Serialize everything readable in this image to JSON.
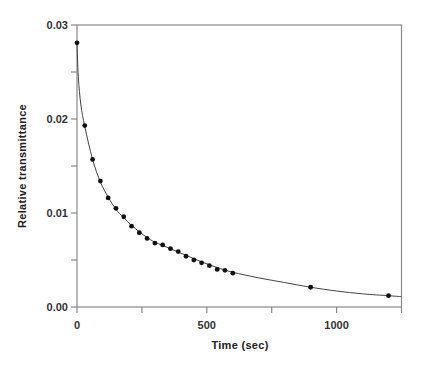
{
  "chart_data": {
    "type": "scatter",
    "title": "",
    "xlabel": "Time (sec)",
    "ylabel": "Relative transmittance",
    "xlim": [
      0,
      1250
    ],
    "ylim": [
      0,
      0.03
    ],
    "x_ticks": [
      0,
      250,
      500,
      750,
      1000,
      1250
    ],
    "x_tick_labels": [
      {
        "value": 0,
        "label": "0"
      },
      {
        "value": 500,
        "label": "500"
      },
      {
        "value": 1000,
        "label": "1000"
      }
    ],
    "y_ticks": [
      0,
      0.005,
      0.01,
      0.015,
      0.02,
      0.025,
      0.03
    ],
    "y_tick_labels": [
      {
        "value": 0,
        "label": "0.00"
      },
      {
        "value": 0.01,
        "label": "0.01"
      },
      {
        "value": 0.02,
        "label": "0.02"
      },
      {
        "value": 0.03,
        "label": "0.03"
      }
    ],
    "grid": false,
    "legend": "none",
    "series": [
      {
        "name": "measured",
        "style": "markers",
        "x": [
          0,
          30,
          60,
          90,
          120,
          150,
          180,
          210,
          240,
          270,
          300,
          330,
          360,
          390,
          420,
          450,
          480,
          510,
          540,
          570,
          600,
          900,
          1200
        ],
        "y": [
          0.0281,
          0.0193,
          0.0157,
          0.0134,
          0.0116,
          0.0105,
          0.0096,
          0.0086,
          0.0079,
          0.0073,
          0.0068,
          0.0066,
          0.0062,
          0.0059,
          0.0054,
          0.005,
          0.0047,
          0.0044,
          0.004,
          0.0039,
          0.0036,
          0.0021,
          0.0012
        ]
      },
      {
        "name": "fit",
        "style": "line",
        "x": [
          0,
          5,
          15,
          30,
          60,
          90,
          120,
          150,
          180,
          210,
          240,
          270,
          300,
          360,
          420,
          480,
          540,
          600,
          700,
          800,
          900,
          1000,
          1100,
          1200,
          1250
        ],
        "y": [
          0.0281,
          0.0245,
          0.0215,
          0.0192,
          0.0157,
          0.0133,
          0.0117,
          0.0104,
          0.0095,
          0.0087,
          0.008,
          0.0074,
          0.0069,
          0.0062,
          0.0055,
          0.0048,
          0.0042,
          0.0037,
          0.0031,
          0.0026,
          0.0021,
          0.0017,
          0.0014,
          0.0012,
          0.0011
        ]
      }
    ]
  }
}
